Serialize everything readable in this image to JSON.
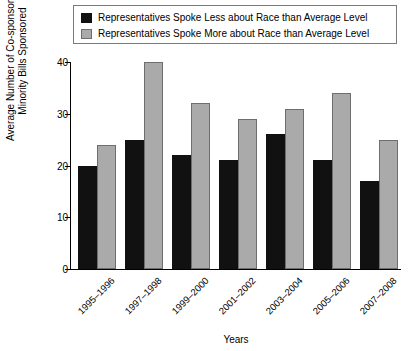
{
  "chart_data": {
    "type": "bar",
    "title": "",
    "xlabel": "Years",
    "ylabel": "Average Number of Co-sponsors on Minority Bills Sponsored",
    "ylabel_lines": [
      "Average Number of Co-sponsors on",
      "Minority Bills Sponsored"
    ],
    "categories": [
      "1995–1996",
      "1997–1998",
      "1999–2000",
      "2001–2002",
      "2003–2004",
      "2005–2006",
      "2007–2008"
    ],
    "series": [
      {
        "name": "Representatives Spoke Less about Race than Average Level",
        "color": "#111111",
        "values": [
          20,
          25,
          22,
          21,
          26,
          21,
          17
        ]
      },
      {
        "name": "Representatives Spoke More about Race than Average Level",
        "color": "#aaaaaa",
        "values": [
          24,
          40,
          32,
          29,
          31,
          34,
          25
        ]
      }
    ],
    "ylim": [
      0,
      40
    ],
    "yticks": [
      0,
      10,
      20,
      30,
      40
    ],
    "ytick_labels": [
      "0",
      "10",
      "20",
      "30",
      "40"
    ],
    "grid": false,
    "legend_position": "top"
  },
  "legend": {
    "items": [
      {
        "label": "Representatives Spoke Less about Race than Average Level",
        "swatch": "black-square"
      },
      {
        "label": "Representatives Spoke More about Race than Average Level",
        "swatch": "gray-square"
      }
    ]
  }
}
